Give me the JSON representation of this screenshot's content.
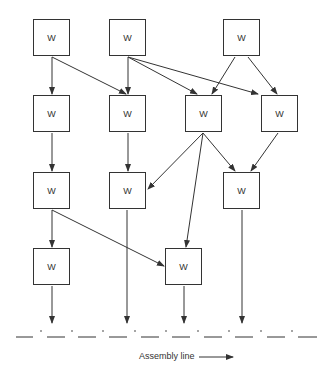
{
  "diagram": {
    "node_label": "W",
    "nodes": [
      {
        "id": "r1c1",
        "label": "W",
        "x": 33,
        "y": 19
      },
      {
        "id": "r1c2",
        "label": "W",
        "x": 109,
        "y": 19
      },
      {
        "id": "r1c3",
        "label": "W",
        "x": 223,
        "y": 19
      },
      {
        "id": "r2c1",
        "label": "W",
        "x": 33,
        "y": 95
      },
      {
        "id": "r2c2",
        "label": "W",
        "x": 109,
        "y": 95
      },
      {
        "id": "r2c3",
        "label": "W",
        "x": 185,
        "y": 95
      },
      {
        "id": "r2c4",
        "label": "W",
        "x": 261,
        "y": 95
      },
      {
        "id": "r3c1",
        "label": "W",
        "x": 33,
        "y": 172
      },
      {
        "id": "r3c2",
        "label": "W",
        "x": 109,
        "y": 172
      },
      {
        "id": "r3c3",
        "label": "W",
        "x": 223,
        "y": 172
      },
      {
        "id": "r4c1",
        "label": "W",
        "x": 33,
        "y": 248
      },
      {
        "id": "r4c2",
        "label": "W",
        "x": 165,
        "y": 248
      }
    ],
    "edges": [
      [
        "r1c1",
        "r2c1"
      ],
      [
        "r1c1",
        "r2c2"
      ],
      [
        "r1c2",
        "r2c2"
      ],
      [
        "r1c2",
        "r2c3"
      ],
      [
        "r1c2",
        "r2c4"
      ],
      [
        "r1c3",
        "r2c3"
      ],
      [
        "r1c3",
        "r2c4"
      ],
      [
        "r2c1",
        "r3c1"
      ],
      [
        "r2c2",
        "r3c2"
      ],
      [
        "r2c3",
        "r3c2"
      ],
      [
        "r2c3",
        "r4c2"
      ],
      [
        "r2c3",
        "r3c3"
      ],
      [
        "r2c4",
        "r3c3"
      ],
      [
        "r3c1",
        "r4c1"
      ],
      [
        "r3c1",
        "r4c2"
      ],
      [
        "r4c1",
        "assembly"
      ],
      [
        "r3c2",
        "assembly"
      ],
      [
        "r4c2",
        "assembly"
      ],
      [
        "r3c3",
        "assembly"
      ]
    ],
    "assembly_line_label": "Assembly line"
  }
}
